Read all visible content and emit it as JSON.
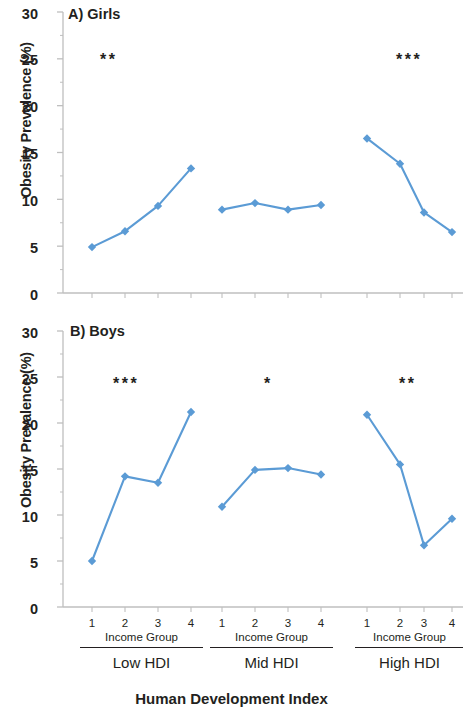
{
  "figure": {
    "xaxis_title": "Human Development Index",
    "yaxis_title": "Obesity Prevalence (%)"
  },
  "panels": [
    {
      "title": "A) Girls"
    },
    {
      "title": "B) Boys"
    }
  ],
  "groups": [
    {
      "hdi_label": "Low HDI",
      "income_label": "Income Group",
      "ticks": [
        "1",
        "2",
        "3",
        "4"
      ]
    },
    {
      "hdi_label": "Mid HDI",
      "income_label": "Income Group",
      "ticks": [
        "1",
        "2",
        "3",
        "4"
      ]
    },
    {
      "hdi_label": "High HDI",
      "income_label": "Income Group",
      "ticks": [
        "1",
        "2",
        "3",
        "4"
      ]
    }
  ],
  "yticks": [
    "0",
    "5",
    "10",
    "15",
    "20",
    "25",
    "30"
  ],
  "significance": {
    "girls": [
      "**",
      "",
      "***"
    ],
    "boys": [
      "***",
      "*",
      "**"
    ]
  },
  "colors": {
    "series": "#5B9BD5",
    "axis": "#bfbfbf",
    "text": "#231f20"
  },
  "chart_data": [
    {
      "type": "line",
      "title": "A) Girls",
      "xlabel": "Human Development Index",
      "ylabel": "Obesity Prevalence (%)",
      "ylim": [
        0,
        30
      ],
      "ytick_values": [
        0,
        5,
        10,
        15,
        20,
        25,
        30
      ],
      "grid": false,
      "legend": "none",
      "categories": [
        "1",
        "2",
        "3",
        "4"
      ],
      "series": [
        {
          "name": "Low HDI",
          "values": [
            4.9,
            6.6,
            9.3,
            13.3
          ],
          "significance": "**"
        },
        {
          "name": "Mid HDI",
          "values": [
            8.9,
            9.6,
            8.9,
            9.4
          ],
          "significance": ""
        },
        {
          "name": "High HDI",
          "values": [
            16.5,
            13.8,
            8.6,
            6.5
          ],
          "significance": "***"
        }
      ]
    },
    {
      "type": "line",
      "title": "B) Boys",
      "xlabel": "Human Development Index",
      "ylabel": "Obesity Prevalence (%)",
      "ylim": [
        0,
        30
      ],
      "ytick_values": [
        0,
        5,
        10,
        15,
        20,
        25,
        30
      ],
      "grid": false,
      "legend": "none",
      "categories": [
        "1",
        "2",
        "3",
        "4"
      ],
      "series": [
        {
          "name": "Low HDI",
          "values": [
            5.0,
            14.2,
            13.5,
            21.2
          ],
          "significance": "***"
        },
        {
          "name": "Mid HDI",
          "values": [
            10.9,
            14.9,
            15.1,
            14.4
          ],
          "significance": "*"
        },
        {
          "name": "High HDI",
          "values": [
            20.9,
            15.5,
            6.7,
            9.6
          ],
          "significance": "**"
        }
      ]
    }
  ]
}
